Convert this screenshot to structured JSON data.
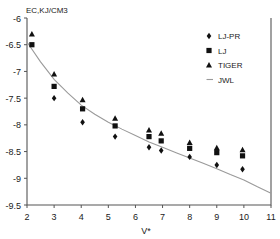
{
  "chart_data": {
    "type": "scatter",
    "title": "",
    "ylabel": "EC,KJ/CM3",
    "xlabel": "V*",
    "xlim": [
      2,
      11
    ],
    "ylim": [
      -9.5,
      -6.0
    ],
    "xticks": [
      "2",
      "3",
      "4",
      "5",
      "6",
      "7",
      "8",
      "9",
      "10",
      "11"
    ],
    "yticks": [
      "-6",
      "-6.5",
      "-7",
      "-7.5",
      "-8",
      "-8.5",
      "-9",
      "-9.5"
    ],
    "grid": false,
    "legend_position": "top-right-inside",
    "series": [
      {
        "name": "LJ-PR",
        "marker": "diamond",
        "color": "#111111",
        "points": [
          {
            "x": 3.0,
            "y": -7.5
          },
          {
            "x": 4.05,
            "y": -7.95
          },
          {
            "x": 5.25,
            "y": -8.22
          },
          {
            "x": 6.5,
            "y": -8.42
          },
          {
            "x": 6.95,
            "y": -8.48
          },
          {
            "x": 8.0,
            "y": -8.6
          },
          {
            "x": 9.0,
            "y": -8.75
          },
          {
            "x": 9.95,
            "y": -8.83
          }
        ]
      },
      {
        "name": "LJ",
        "marker": "square",
        "color": "#111111",
        "points": [
          {
            "x": 2.18,
            "y": -6.5
          },
          {
            "x": 3.0,
            "y": -7.28
          },
          {
            "x": 4.05,
            "y": -7.7
          },
          {
            "x": 5.25,
            "y": -8.02
          },
          {
            "x": 6.5,
            "y": -8.22
          },
          {
            "x": 6.95,
            "y": -8.3
          },
          {
            "x": 8.0,
            "y": -8.44
          },
          {
            "x": 9.0,
            "y": -8.52
          },
          {
            "x": 9.95,
            "y": -8.58
          }
        ]
      },
      {
        "name": "TIGER",
        "marker": "triangle",
        "color": "#111111",
        "points": [
          {
            "x": 2.18,
            "y": -6.3
          },
          {
            "x": 3.0,
            "y": -7.05
          },
          {
            "x": 4.05,
            "y": -7.53
          },
          {
            "x": 5.25,
            "y": -7.88
          },
          {
            "x": 6.5,
            "y": -8.1
          },
          {
            "x": 6.95,
            "y": -8.16
          },
          {
            "x": 8.0,
            "y": -8.33
          },
          {
            "x": 9.0,
            "y": -8.43
          },
          {
            "x": 9.95,
            "y": -8.47
          }
        ]
      },
      {
        "name": "JWL",
        "marker": "line",
        "color": "#9a9a9a",
        "curve": [
          {
            "x": 2.0,
            "y": -6.45
          },
          {
            "x": 2.5,
            "y": -6.82
          },
          {
            "x": 3.0,
            "y": -7.15
          },
          {
            "x": 3.5,
            "y": -7.4
          },
          {
            "x": 4.0,
            "y": -7.63
          },
          {
            "x": 4.5,
            "y": -7.8
          },
          {
            "x": 5.0,
            "y": -7.95
          },
          {
            "x": 5.5,
            "y": -8.08
          },
          {
            "x": 6.0,
            "y": -8.2
          },
          {
            "x": 6.5,
            "y": -8.32
          },
          {
            "x": 7.0,
            "y": -8.42
          },
          {
            "x": 7.5,
            "y": -8.52
          },
          {
            "x": 8.0,
            "y": -8.62
          },
          {
            "x": 8.5,
            "y": -8.72
          },
          {
            "x": 9.0,
            "y": -8.82
          },
          {
            "x": 9.5,
            "y": -8.93
          },
          {
            "x": 10.0,
            "y": -9.03
          },
          {
            "x": 10.5,
            "y": -9.16
          },
          {
            "x": 11.0,
            "y": -9.28
          }
        ]
      }
    ],
    "legend": [
      {
        "label": "LJ-PR",
        "marker": "diamond"
      },
      {
        "label": "LJ",
        "marker": "square"
      },
      {
        "label": "TIGER",
        "marker": "triangle"
      },
      {
        "label": "JWL",
        "marker": "line"
      }
    ]
  }
}
